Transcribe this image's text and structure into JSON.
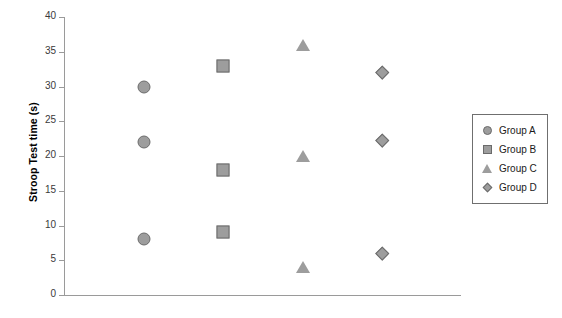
{
  "chart_data": {
    "type": "scatter",
    "title": "",
    "xlabel": "",
    "ylabel": "Stroop Test time (s)",
    "ylim": [
      0,
      40
    ],
    "yticks": [
      0,
      5,
      10,
      15,
      20,
      25,
      30,
      35,
      40
    ],
    "ytick_labels": [
      "0",
      "5",
      "10",
      "15",
      "20",
      "25",
      "30",
      "35",
      "40"
    ],
    "xlim": [
      0,
      5
    ],
    "xticks": [],
    "xtick_labels": [],
    "grid": false,
    "legend_position": "right",
    "series": [
      {
        "name": "Group A",
        "marker": "circle",
        "x": [
          1,
          1,
          1
        ],
        "values": [
          30,
          22,
          8
        ]
      },
      {
        "name": "Group B",
        "marker": "square",
        "x": [
          2,
          2,
          2
        ],
        "values": [
          33,
          18,
          9
        ]
      },
      {
        "name": "Group C",
        "marker": "triangle",
        "x": [
          3,
          3,
          3
        ],
        "values": [
          36,
          20,
          4
        ]
      },
      {
        "name": "Group D",
        "marker": "diamond",
        "x": [
          4,
          4,
          4
        ],
        "values": [
          32,
          22.3,
          6
        ]
      }
    ],
    "colors": {
      "marker_fill": "#9d9d9d",
      "marker_edge": "#6b6b6b",
      "axis": "#9a9a9a",
      "text": "#1a1a1a",
      "background": "#ffffff"
    }
  },
  "legend": {
    "items": [
      {
        "label": "Group A",
        "marker": "circle"
      },
      {
        "label": "Group B",
        "marker": "square"
      },
      {
        "label": "Group C",
        "marker": "triangle"
      },
      {
        "label": "Group D",
        "marker": "diamond"
      }
    ]
  }
}
